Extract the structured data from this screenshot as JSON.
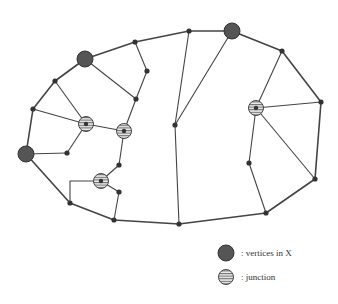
{
  "diagram": {
    "colors": {
      "edge": "#444444",
      "node": "#333333",
      "x_vertex_fill": "#555555",
      "junction_fill": "#e8e8e8",
      "junction_hatch": "#555555"
    },
    "nodes": [
      {
        "id": "x1",
        "type": "x_vertex",
        "x": 85,
        "y": 59
      },
      {
        "id": "x2",
        "type": "x_vertex",
        "x": 232,
        "y": 31
      },
      {
        "id": "x3",
        "type": "x_vertex",
        "x": 26,
        "y": 154
      },
      {
        "id": "j1",
        "type": "junction",
        "x": 86,
        "y": 124
      },
      {
        "id": "j2",
        "type": "junction",
        "x": 124,
        "y": 131
      },
      {
        "id": "j3",
        "type": "junction",
        "x": 101,
        "y": 181
      },
      {
        "id": "j4",
        "type": "junction",
        "x": 256,
        "y": 108
      },
      {
        "id": "n1",
        "type": "node",
        "x": 135,
        "y": 42
      },
      {
        "id": "n2",
        "type": "node",
        "x": 147,
        "y": 71
      },
      {
        "id": "n3",
        "type": "node",
        "x": 136,
        "y": 99
      },
      {
        "id": "n4",
        "type": "node",
        "x": 55,
        "y": 81
      },
      {
        "id": "n5",
        "type": "node",
        "x": 33,
        "y": 109
      },
      {
        "id": "n6",
        "type": "node",
        "x": 189,
        "y": 31
      },
      {
        "id": "n7",
        "type": "node",
        "x": 282,
        "y": 51
      },
      {
        "id": "n8",
        "type": "node",
        "x": 321,
        "y": 102
      },
      {
        "id": "n9",
        "type": "node",
        "x": 175,
        "y": 125
      },
      {
        "id": "n10",
        "type": "node",
        "x": 67,
        "y": 153
      },
      {
        "id": "n11",
        "type": "node",
        "x": 119,
        "y": 165
      },
      {
        "id": "n12",
        "type": "node",
        "x": 119,
        "y": 192
      },
      {
        "id": "n13",
        "type": "node",
        "x": 70,
        "y": 203
      },
      {
        "id": "n14",
        "type": "node",
        "x": 114,
        "y": 220
      },
      {
        "id": "n15",
        "type": "node",
        "x": 249,
        "y": 163
      },
      {
        "id": "n16",
        "type": "node",
        "x": 315,
        "y": 179
      },
      {
        "id": "n17",
        "type": "node",
        "x": 266,
        "y": 213
      },
      {
        "id": "n18",
        "type": "node",
        "x": 179,
        "y": 224
      }
    ],
    "outer_cycle": [
      "x1",
      "n1",
      "n6",
      "x2",
      "n7",
      "n8",
      "n16",
      "n17",
      "n18",
      "n14",
      "n13",
      "x3",
      "n5",
      "n4",
      "x1"
    ],
    "inner_edges": [
      [
        "n1",
        "n2"
      ],
      [
        "n2",
        "n3"
      ],
      [
        "x1",
        "n3"
      ],
      [
        "n3",
        "j2"
      ],
      [
        "n4",
        "j1"
      ],
      [
        "n5",
        "j1"
      ],
      [
        "j1",
        "j2"
      ],
      [
        "j1",
        "n10"
      ],
      [
        "x3",
        "n10"
      ],
      [
        "j2",
        "n11"
      ],
      [
        "n11",
        "j3"
      ],
      [
        "j3",
        "n12"
      ],
      [
        "n12",
        "n14"
      ],
      [
        "n6",
        "n9"
      ],
      [
        "x2",
        "n9"
      ],
      [
        "n9",
        "n18"
      ],
      [
        "n7",
        "j4"
      ],
      [
        "j4",
        "n8"
      ],
      [
        "j4",
        "n16"
      ],
      [
        "j4",
        "n15"
      ],
      [
        "n15",
        "n17"
      ]
    ],
    "polyline_edges": [
      [
        [
          101,
          181
        ],
        [
          70,
          181
        ],
        [
          70,
          203
        ]
      ]
    ]
  },
  "legend": {
    "items": [
      {
        "symbol": "x_vertex",
        "label": ": vertices in X",
        "x": 226,
        "y": 253
      },
      {
        "symbol": "junction",
        "label": ": junction",
        "x": 226,
        "y": 277
      }
    ]
  }
}
